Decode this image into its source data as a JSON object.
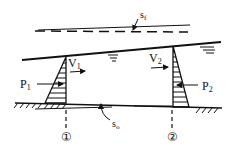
{
  "diagram": {
    "type": "open-channel-flow-momentum",
    "labels": {
      "energy_slope": "s",
      "energy_slope_sub": "f",
      "bed_slope": "s",
      "bed_slope_sub": "o",
      "velocity_1": "V",
      "velocity_1_sub": "1",
      "velocity_2": "V",
      "velocity_2_sub": "2",
      "pressure_1": "P",
      "pressure_1_sub": "1",
      "pressure_2": "P",
      "pressure_2_sub": "2",
      "section_1": "①",
      "section_2": "②"
    },
    "colors": {
      "ink": "#111111",
      "background": "#ffffff"
    }
  }
}
